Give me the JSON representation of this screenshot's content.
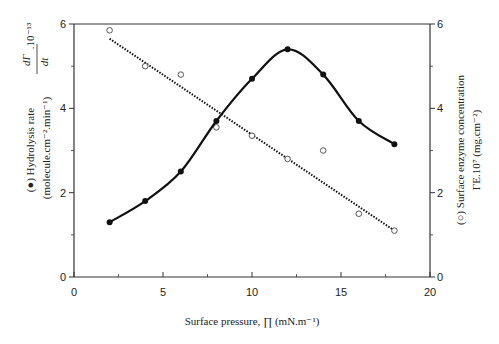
{
  "chart_data": {
    "type": "line",
    "title": "",
    "xlabel": "Surface pressure, ∏ (mN.m⁻¹)",
    "ylabel_left": {
      "line1": "(●) Hydrolysis rate",
      "line2": "(molecule.cm⁻².min⁻¹)",
      "fraction_num": "dΓ",
      "fraction_sub": "Pℓ",
      "fraction_den": "dt",
      "multiplier": ".10⁻¹³"
    },
    "ylabel_right": {
      "line1": "(○) Surface enzyme concentration",
      "line2": "ΓE.10⁷   (mg.cm⁻²)"
    },
    "xlim": [
      0,
      20
    ],
    "ylim_left": [
      0,
      6
    ],
    "ylim_right": [
      0,
      6
    ],
    "x_ticks": [
      0,
      5,
      10,
      15,
      20
    ],
    "y_ticks_left": [
      0,
      2,
      4,
      6
    ],
    "y_ticks_right": [
      0,
      2,
      4,
      6
    ],
    "grid": false,
    "series": [
      {
        "name": "Hydrolysis rate",
        "marker": "filled-circle",
        "line": "solid smooth curve",
        "axis": "left",
        "x": [
          2,
          4,
          6,
          8,
          10,
          12,
          14,
          16,
          18
        ],
        "values": [
          1.3,
          1.8,
          2.5,
          3.7,
          4.7,
          5.4,
          4.8,
          3.7,
          3.15
        ]
      },
      {
        "name": "Surface enzyme concentration",
        "marker": "open-circle",
        "line": "dotted linear fit",
        "axis": "right",
        "x": [
          2,
          4,
          6,
          8,
          10,
          12,
          14,
          16,
          18
        ],
        "values": [
          5.85,
          5.0,
          4.8,
          3.55,
          3.35,
          2.8,
          3.0,
          1.5,
          1.1
        ],
        "fit_line": {
          "x": [
            2,
            18
          ],
          "y": [
            5.65,
            1.1
          ]
        }
      }
    ],
    "legend": "inline in axis labels"
  },
  "labels": {
    "x_ticks": [
      "0",
      "5",
      "10",
      "15",
      "20"
    ],
    "y_left_ticks": [
      "0",
      "2",
      "4",
      "6"
    ],
    "y_right_ticks": [
      "0",
      "2",
      "4",
      "6"
    ],
    "xlabel": "Surface pressure, ∏ (mN.m⁻¹)",
    "ylabel_left_1": "(●) Hydrolysis rate",
    "ylabel_left_2": "(molecule.cm⁻².min⁻¹)",
    "ylabel_left_frac_num": "dΓ",
    "ylabel_left_frac_sub": "Pℓ",
    "ylabel_left_frac_den": "dt",
    "ylabel_left_mult": ".10⁻¹³",
    "ylabel_right_1": "(○) Surface enzyme concentration",
    "ylabel_right_2": "ΓE.10⁷   (mg.cm⁻²)"
  },
  "colors": {
    "axis": "#333333",
    "series_line": "#111111",
    "background": "#ffffff"
  }
}
